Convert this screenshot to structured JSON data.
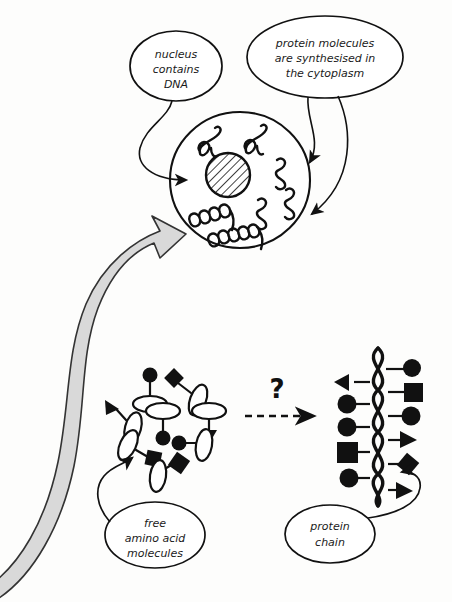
{
  "diagram": {
    "background_color": "#fdfdfc",
    "ink_color": "#111111",
    "gray_arrow_fill": "#d9d9d9",
    "gray_arrow_stroke": "#333333"
  },
  "callouts": [
    {
      "id": "nucleus-callout",
      "lines": [
        "nucleus",
        "contains",
        "DNA"
      ],
      "cx": 176,
      "cy": 66,
      "rx": 46,
      "ry": 35
    },
    {
      "id": "cytoplasm-callout",
      "lines": [
        "protein molecules",
        "are synthesised in",
        "the cytoplasm"
      ],
      "cx": 325,
      "cy": 57,
      "rx": 78,
      "ry": 41
    },
    {
      "id": "amino-acid-callout",
      "lines": [
        "free",
        "amino acid",
        "molecules"
      ],
      "cx": 155,
      "cy": 535,
      "rx": 50,
      "ry": 33
    },
    {
      "id": "protein-chain-callout",
      "lines": [
        "protein",
        "chain"
      ],
      "cx": 330,
      "cy": 534,
      "rx": 45,
      "ry": 29
    }
  ],
  "cell": {
    "label": "cell",
    "cx": 240,
    "cy": 180,
    "r": 70,
    "nucleus": {
      "label": "nucleus",
      "cx": 228,
      "cy": 175,
      "r": 22,
      "hatched": true
    },
    "squiggles": [
      {
        "type": "loop-squiggle",
        "x": 208,
        "y": 142
      },
      {
        "type": "loop-squiggle",
        "x": 252,
        "y": 140
      },
      {
        "type": "small-squiggle",
        "x": 276,
        "y": 170
      },
      {
        "type": "small-squiggle",
        "x": 283,
        "y": 198
      },
      {
        "type": "small-squiggle",
        "x": 257,
        "y": 207
      },
      {
        "type": "coil",
        "x": 196,
        "y": 218
      },
      {
        "type": "coil",
        "x": 220,
        "y": 238
      }
    ]
  },
  "transition": {
    "question_mark": "?",
    "arrow_style": "dashed",
    "x1": 245,
    "y1": 415,
    "x2": 318,
    "y2": 415
  },
  "amino_acids": {
    "label": "free amino acid molecules",
    "items": [
      {
        "shape": "circle",
        "ex": 150,
        "ey": 398,
        "sx": 150,
        "sy": 377
      },
      {
        "shape": "diamond",
        "ex": 193,
        "ey": 392,
        "sx": 172,
        "sy": 379
      },
      {
        "shape": "triangle",
        "ex": 131,
        "ey": 422,
        "sx": 113,
        "sy": 408
      },
      {
        "shape": "circle",
        "ex": 163,
        "ey": 415,
        "sx": 163,
        "sy": 434
      },
      {
        "shape": "triangle",
        "ex": 209,
        "ey": 412,
        "sx": 209,
        "sy": 436
      },
      {
        "shape": "square",
        "ex": 129,
        "ey": 448,
        "sx": 152,
        "sy": 457
      },
      {
        "shape": "circle",
        "ex": 203,
        "ey": 443,
        "sx": 181,
        "sy": 442
      },
      {
        "shape": "square",
        "ex": 158,
        "ey": 474,
        "sx": 177,
        "sy": 462
      }
    ]
  },
  "protein_chain": {
    "label": "protein chain",
    "backbone": "double-helix",
    "x_center": 378,
    "y_top": 352,
    "y_bottom": 500,
    "side_groups": [
      {
        "shape": "circle",
        "side": "right",
        "y": 369
      },
      {
        "shape": "triangle",
        "side": "left",
        "y": 383
      },
      {
        "shape": "square",
        "side": "right",
        "y": 391
      },
      {
        "shape": "circle",
        "side": "left",
        "y": 404
      },
      {
        "shape": "circle",
        "side": "right",
        "y": 415
      },
      {
        "shape": "circle",
        "side": "left",
        "y": 426
      },
      {
        "shape": "triangle",
        "side": "right",
        "y": 439
      },
      {
        "shape": "square",
        "side": "left",
        "y": 451
      },
      {
        "shape": "diamond",
        "side": "right",
        "y": 464
      },
      {
        "shape": "circle",
        "side": "left",
        "y": 478
      },
      {
        "shape": "triangle",
        "side": "right",
        "y": 490
      }
    ]
  },
  "big_arrow": {
    "label": "flow-arrow-from-amino-acids-to-cell",
    "direction": "up-right"
  }
}
